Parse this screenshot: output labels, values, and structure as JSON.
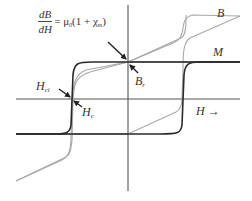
{
  "diagram": {
    "formula": {
      "numerator": "dB",
      "denominator": "dH",
      "rhs_prefix": "= μ",
      "rhs_mu_sub": "0",
      "rhs_mid": "(1 + χ",
      "rhs_chi_sub": "m",
      "rhs_suffix": ")"
    },
    "labels": {
      "B": "B",
      "M": "M",
      "H_axis": "H",
      "H_axis_arrow": "→",
      "Hci_main": "H",
      "Hci_sub": "ci",
      "Hc_main": "H",
      "Hc_sub": "c",
      "Br_main": "B",
      "Br_sub": "r"
    },
    "curves": [
      {
        "name": "M",
        "description": "Magnetization loop (dark), square shaped",
        "color": "#333333"
      },
      {
        "name": "B",
        "description": "Induction loop (light gray), sheared by slope μ0(1+χm)",
        "color": "#a8a8a8"
      }
    ],
    "axes": {
      "color": "#555555"
    }
  }
}
